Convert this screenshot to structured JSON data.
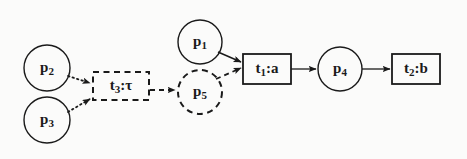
{
  "diagram": {
    "background_color": "#fbfbfa",
    "stroke_color": "#1a1a1a",
    "places": [
      {
        "id": "p1",
        "name": "p",
        "sub": "1",
        "style": "solid",
        "cx": 200,
        "cy": 42,
        "r": 22
      },
      {
        "id": "p2",
        "name": "p",
        "sub": "2",
        "style": "solid",
        "cx": 47,
        "cy": 68,
        "r": 23
      },
      {
        "id": "p3",
        "name": "p",
        "sub": "3",
        "style": "solid",
        "cx": 47,
        "cy": 120,
        "r": 23
      },
      {
        "id": "p4",
        "name": "p",
        "sub": "4",
        "style": "solid",
        "cx": 340,
        "cy": 69,
        "r": 22
      },
      {
        "id": "p5",
        "name": "p",
        "sub": "5",
        "style": "dashed",
        "cx": 200,
        "cy": 92,
        "r": 22
      }
    ],
    "transitions": [
      {
        "id": "t1",
        "name": "t",
        "sub": "1",
        "action": ":a",
        "style": "solid",
        "x": 243,
        "y": 54,
        "w": 48,
        "h": 30
      },
      {
        "id": "t2",
        "name": "t",
        "sub": "2",
        "action": ":b",
        "style": "solid",
        "x": 392,
        "y": 54,
        "w": 48,
        "h": 30
      },
      {
        "id": "t3",
        "name": "t",
        "sub": "3",
        "action": ":τ",
        "style": "dashed",
        "x": 93,
        "y": 72,
        "w": 56,
        "h": 28
      }
    ],
    "arcs": [
      {
        "id": "arc-p2-t3",
        "from": "p2",
        "to": "t3",
        "style": "dotted"
      },
      {
        "id": "arc-p3-t3",
        "from": "p3",
        "to": "t3",
        "style": "dotted"
      },
      {
        "id": "arc-t3-p5",
        "from": "t3",
        "to": "p5",
        "style": "dashed"
      },
      {
        "id": "arc-p5-t1",
        "from": "p5",
        "to": "t1",
        "style": "dashed"
      },
      {
        "id": "arc-p1-t1",
        "from": "p1",
        "to": "t1",
        "style": "solid"
      },
      {
        "id": "arc-t1-p4",
        "from": "t1",
        "to": "p4",
        "style": "solid"
      },
      {
        "id": "arc-p4-t2",
        "from": "p4",
        "to": "t2",
        "style": "solid"
      }
    ]
  }
}
